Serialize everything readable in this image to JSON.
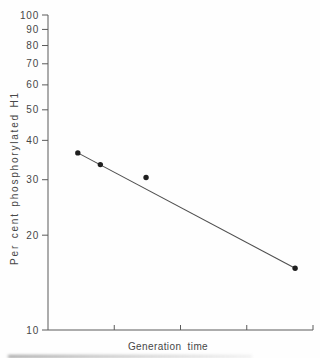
{
  "window": {
    "width": 320,
    "height": 358,
    "background": "#fefefe"
  },
  "colors": {
    "ink": "#474747",
    "axis": "#5a5a5a",
    "point": "#1f1f1f",
    "trend": "#4f4f4f"
  },
  "chart_data": {
    "type": "scatter",
    "title": "",
    "xlabel": "Generation time",
    "ylabel": "Per cent phosphorylated H1",
    "x_scale": "linear",
    "y_scale": "log",
    "xlim": [
      0,
      4
    ],
    "ylim": [
      10,
      100
    ],
    "y_ticks": [
      100,
      90,
      80,
      70,
      60,
      50,
      40,
      30,
      20,
      10
    ],
    "x_ticks": [
      1,
      2,
      3,
      4
    ],
    "x_tick_labels_shown": false,
    "grid": false,
    "legend": null,
    "points": [
      {
        "x": 0.45,
        "y": 36.5
      },
      {
        "x": 0.79,
        "y": 33.5
      },
      {
        "x": 1.48,
        "y": 30.5
      },
      {
        "x": 3.73,
        "y": 15.7
      }
    ],
    "trend_line": {
      "x1": 0.45,
      "y1": 36.5,
      "x2": 3.73,
      "y2": 15.7
    }
  }
}
